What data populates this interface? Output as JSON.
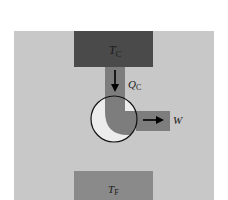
{
  "diagram": {
    "type": "heat-engine-schematic",
    "hot_reservoir": {
      "symbol": "T",
      "subscript": "C"
    },
    "cold_reservoir": {
      "symbol": "T",
      "subscript": "F"
    },
    "heat_in": {
      "symbol": "Q",
      "subscript": "C"
    },
    "work_out": {
      "symbol": "W"
    },
    "colors": {
      "background_panel": "#c8c8c8",
      "hot_reservoir": "#4a4a4a",
      "cold_reservoir": "#8a8a8a",
      "flow_channel": "#7d7d7d",
      "engine_fill": "#ececec",
      "outline": "#111111",
      "arrow": "#000000"
    }
  }
}
